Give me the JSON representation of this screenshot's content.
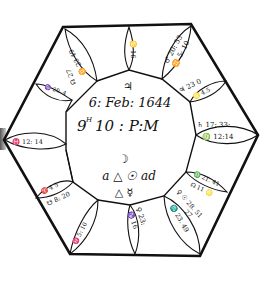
{
  "figure": {
    "type": "astrological horary chart (hexagonal woodcut)",
    "center": {
      "planet_symbol": "♃",
      "date_line": "6: Feb: 1644",
      "time_line_hour": "9",
      "time_line_sup": "H",
      "time_line_rest": "10 : P:M",
      "aspect_line_1_moon": "☽",
      "aspect_line_2": "a △ ☉ ad",
      "aspect_line_3": "△ ☿"
    },
    "houses": [
      {
        "position": "top",
        "text_1": "♋ 16",
        "text_2": ""
      },
      {
        "position": "top-right",
        "text_1": "♂ 20: 53",
        "text_2": "♊ 5: 10"
      },
      {
        "position": "right-upper",
        "text_1": "♃ 23 0",
        "text_2": "♌ 4.5"
      },
      {
        "position": "right",
        "text_1": "♄ 17: 33:",
        "text_2": "♍ 12:14"
      },
      {
        "position": "right-lower",
        "text_1": "♎ 21. 41",
        "text_2": "☊ 11 ♌"
      },
      {
        "position": "bottom-right-a",
        "text_1": "♀ ☉ 28. 51",
        "text_2": "27"
      },
      {
        "position": "bottom-right-b",
        "text_1": "♏ 23. 49",
        "text_2": ""
      },
      {
        "position": "bottom",
        "text_1": "♀ 23:",
        "text_2": "♑ 16"
      },
      {
        "position": "bottom-left",
        "text_1": "♓ 5: 10",
        "text_2": ""
      },
      {
        "position": "left-lower",
        "text_1": "♈ 4 5",
        "text_2": "☋ 8: 20"
      },
      {
        "position": "left",
        "text_1": "♓ 12: 14",
        "text_2": ""
      },
      {
        "position": "left-upper",
        "text_1": "♑ 20. 4",
        "text_2": ""
      },
      {
        "position": "top-left",
        "text_1": "♊ 23 49",
        "text_2": "☊ 27"
      }
    ]
  }
}
